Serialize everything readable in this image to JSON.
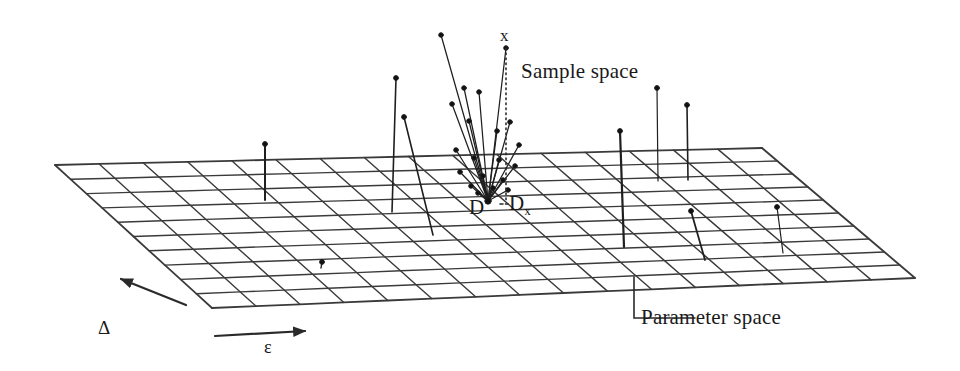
{
  "figure": {
    "background_color": "#ffffff",
    "ink_color": "#2a2a2a",
    "width": 960,
    "height": 371
  },
  "labels": {
    "sample_space": "Sample space",
    "parameter_space": "Parameter space",
    "point_x": "x",
    "set_D": "D",
    "set_Dx_base": "D",
    "set_Dx_sub": "x",
    "axis_delta": "Δ",
    "axis_epsilon": "ε"
  },
  "chart_data": {
    "type": "scatter",
    "xlabel": "ε",
    "ylabel": "Δ",
    "legend": [],
    "grid": true,
    "annotations": [
      {
        "text": "Sample space",
        "x": 521,
        "y": 72
      },
      {
        "text": "Parameter space",
        "x": 641,
        "y": 318
      },
      {
        "text": "x",
        "x": 506,
        "y": 36
      },
      {
        "text": "D",
        "x": 478,
        "y": 210
      },
      {
        "text": "Dx",
        "x": 520,
        "y": 206
      },
      {
        "text": "Δ",
        "x": 104,
        "y": 327
      },
      {
        "text": "ε",
        "x": 270,
        "y": 346
      }
    ],
    "plane": {
      "description": "Perspective parameter-space mesh (quadrilateral grid)",
      "corners": [
        [
          55,
          165
        ],
        [
          762,
          148
        ],
        [
          915,
          278
        ],
        [
          212,
          308
        ]
      ],
      "columns": 16,
      "rows": 10
    },
    "fan": {
      "description": "Bundle of sample-space needles converging on D",
      "apex": [
        488,
        201
      ],
      "tips": [
        [
          441,
          35
        ],
        [
          506,
          48
        ],
        [
          464,
          88
        ],
        [
          479,
          92
        ],
        [
          452,
          104
        ],
        [
          469,
          121
        ],
        [
          497,
          131
        ],
        [
          510,
          122
        ],
        [
          519,
          145
        ],
        [
          456,
          150
        ],
        [
          474,
          158
        ],
        [
          499,
          160
        ],
        [
          515,
          166
        ],
        [
          460,
          172
        ],
        [
          483,
          176
        ],
        [
          503,
          180
        ],
        [
          471,
          186
        ],
        [
          493,
          188
        ],
        [
          508,
          190
        ],
        [
          478,
          193
        ]
      ]
    },
    "needles": [
      {
        "base": [
          265,
          200
        ],
        "tip": [
          265,
          144
        ],
        "weight": 2.0
      },
      {
        "base": [
          392,
          212
        ],
        "tip": [
          396,
          78
        ],
        "weight": 1.6
      },
      {
        "base": [
          433,
          235
        ],
        "tip": [
          404,
          117
        ],
        "weight": 1.6
      },
      {
        "base": [
          321,
          268
        ],
        "tip": [
          322,
          262
        ],
        "weight": 1.4
      },
      {
        "base": [
          624,
          247
        ],
        "tip": [
          620,
          131
        ],
        "weight": 2.2
      },
      {
        "base": [
          658,
          181
        ],
        "tip": [
          657,
          88
        ],
        "weight": 1.2
      },
      {
        "base": [
          688,
          180
        ],
        "tip": [
          687,
          105
        ],
        "weight": 1.6
      },
      {
        "base": [
          705,
          260
        ],
        "tip": [
          691,
          211
        ],
        "weight": 1.8
      },
      {
        "base": [
          783,
          253
        ],
        "tip": [
          777,
          207
        ],
        "weight": 1.2
      }
    ],
    "dropline": {
      "from": [
        506,
        48
      ],
      "to": [
        506,
        200
      ],
      "style": "dotted"
    },
    "leaders": [
      {
        "name": "Dx-leader",
        "path": [
          [
            500,
            204
          ],
          [
            508,
            204
          ]
        ],
        "style": "dashed"
      },
      {
        "name": "parameter-space-leader",
        "path": [
          [
            634,
            277
          ],
          [
            634,
            318
          ],
          [
            695,
            318
          ]
        ],
        "style": "solid"
      }
    ],
    "axis_arrows": [
      {
        "name": "delta",
        "from": [
          186,
          305
        ],
        "to": [
          121,
          279
        ],
        "label": "Δ"
      },
      {
        "name": "epsilon",
        "from": [
          215,
          336
        ],
        "to": [
          305,
          331
        ],
        "label": "ε"
      }
    ]
  }
}
